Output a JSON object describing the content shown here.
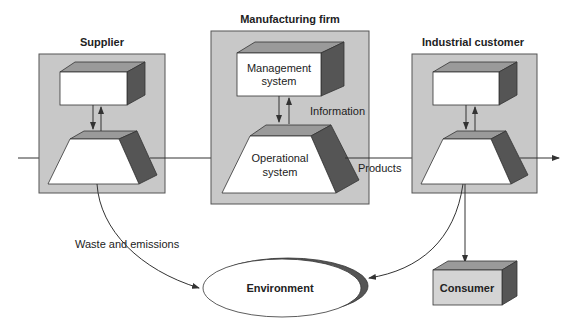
{
  "panels": {
    "supplier": {
      "title": "Supplier"
    },
    "manufacturer": {
      "title": "Manufacturing firm",
      "management": "Management",
      "management2": "system",
      "operational": "Operational",
      "operational2": "system"
    },
    "customer": {
      "title": "Industrial customer"
    }
  },
  "labels": {
    "information": "Information",
    "products": "Products",
    "waste": "Waste and emissions",
    "environment": "Environment",
    "consumer": "Consumer"
  },
  "colors": {
    "panel_fill": "#c8c8c8",
    "panel_stroke": "#555555",
    "box_top": "#9a9a9a",
    "box_side": "#555555",
    "box_front": "#ffffff",
    "consumer_front": "#d4d4d4",
    "line": "#333333"
  }
}
